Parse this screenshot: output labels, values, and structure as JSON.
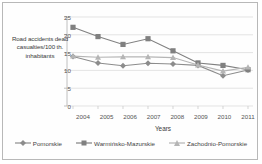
{
  "chart_data": {
    "type": "line",
    "title": "",
    "xlabel": "Years",
    "ylabel": "Road accidents dead casualties/100 th. inhabitants",
    "categories": [
      "2004",
      "2005",
      "2006",
      "2007",
      "2008",
      "2009",
      "2010",
      "2011"
    ],
    "ylim": [
      0,
      25
    ],
    "yticks": [
      0,
      5,
      10,
      15,
      20,
      25
    ],
    "grid": true,
    "legend_position": "bottom",
    "series": [
      {
        "name": "Pomorskie",
        "marker": "diamond",
        "color": "#8c8c8c",
        "values": [
          13.9,
          12.1,
          11.3,
          12.0,
          11.8,
          11.4,
          8.5,
          10.1
        ]
      },
      {
        "name": "Warmińsko-Mazurskie",
        "marker": "square",
        "color": "#808080",
        "values": [
          22.1,
          19.5,
          17.3,
          18.9,
          15.5,
          12.1,
          11.4,
          10.2
        ]
      },
      {
        "name": "Zachodnio-Pomorskie",
        "marker": "triangle",
        "color": "#b5b5b5",
        "values": [
          14.0,
          13.7,
          13.8,
          13.8,
          13.6,
          11.5,
          9.8,
          10.9
        ]
      }
    ]
  },
  "axis": {
    "ytick_labels": [
      "25",
      "20",
      "15",
      "10",
      "5",
      "0"
    ],
    "xtick_labels": [
      "2004",
      "2005",
      "2006",
      "2007",
      "2008",
      "2009",
      "2010",
      "2011"
    ]
  },
  "legend": {
    "items": [
      {
        "label": "Pomorskie",
        "marker": "diamond"
      },
      {
        "label": "Warmińsko-Mazurskie",
        "marker": "square"
      },
      {
        "label": "Zachodnio-Pomorskie",
        "marker": "triangle"
      }
    ]
  }
}
